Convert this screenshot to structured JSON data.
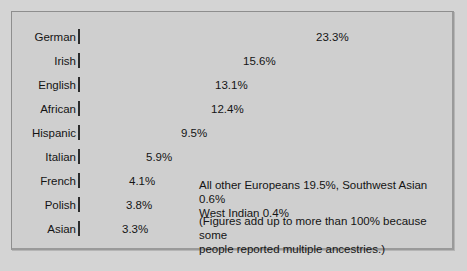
{
  "chart_data": {
    "type": "bar",
    "title": "",
    "subtitle": "",
    "xlabel": "",
    "ylabel": "",
    "orientation": "horizontal",
    "grid": false,
    "legend": "none",
    "xlim": [
      0,
      25
    ],
    "categories": [
      "German",
      "Irish",
      "English",
      "African",
      "Hispanic",
      "Italian",
      "French",
      "Polish",
      "Asian"
    ],
    "values": [
      23.3,
      15.6,
      13.1,
      12.4,
      9.5,
      5.9,
      4.1,
      3.8,
      3.3
    ],
    "value_labels": [
      "23.3%",
      "15.6%",
      "13.1%",
      "12.4%",
      "9.5%",
      "5.9%",
      "4.1%",
      "3.8%",
      "3.3%"
    ],
    "bar_colors": [
      "#6e6e6e",
      "#a5a5a5",
      "#8a8a8a",
      "#bdbdbd",
      "#a8a8a8",
      "#cdcdcd",
      "#3d3d3d",
      "#4f4f4f",
      "#474747"
    ],
    "annotations": [
      "All other Europeans 19.5%, Southwest Asian 0.6%\nWest Indian 0.4%",
      "(Figures add up to more than 100% because some\npeople reported multiple ancestries.)"
    ]
  },
  "figure": {
    "background_color": "#cfcfcf",
    "border_color": "#8e8e8e"
  },
  "bars": [
    {
      "label": "German",
      "value": "23.3%",
      "width_px": 232,
      "color": "#6e6e6e",
      "top": 16
    },
    {
      "label": "Irish",
      "value": "15.6%",
      "width_px": 159,
      "color": "#a5a5a5",
      "top": 40
    },
    {
      "label": "English",
      "value": "13.1%",
      "width_px": 131,
      "color": "#8a8a8a",
      "top": 64
    },
    {
      "label": "African",
      "value": "12.4%",
      "width_px": 127,
      "color": "#bdbdbd",
      "top": 88
    },
    {
      "label": "Hispanic",
      "value": "9.5%",
      "width_px": 97,
      "color": "#a8a8a8",
      "top": 112
    },
    {
      "label": "Italian",
      "value": "5.9%",
      "width_px": 62,
      "color": "#cdcdcd",
      "top": 136
    },
    {
      "label": "French",
      "value": "4.1%",
      "width_px": 45,
      "color": "#3d3d3d",
      "top": 160
    },
    {
      "label": "Polish",
      "value": "3.8%",
      "width_px": 42,
      "color": "#4f4f4f",
      "top": 184
    },
    {
      "label": "Asian",
      "value": "3.3%",
      "width_px": 38,
      "color": "#474747",
      "top": 208
    }
  ],
  "annotations": {
    "other_ancestries": "All other Europeans 19.5%, Southwest Asian 0.6%\nWest Indian 0.4%",
    "footnote": "(Figures add up to more than 100% because some\npeople reported multiple ancestries.)"
  }
}
